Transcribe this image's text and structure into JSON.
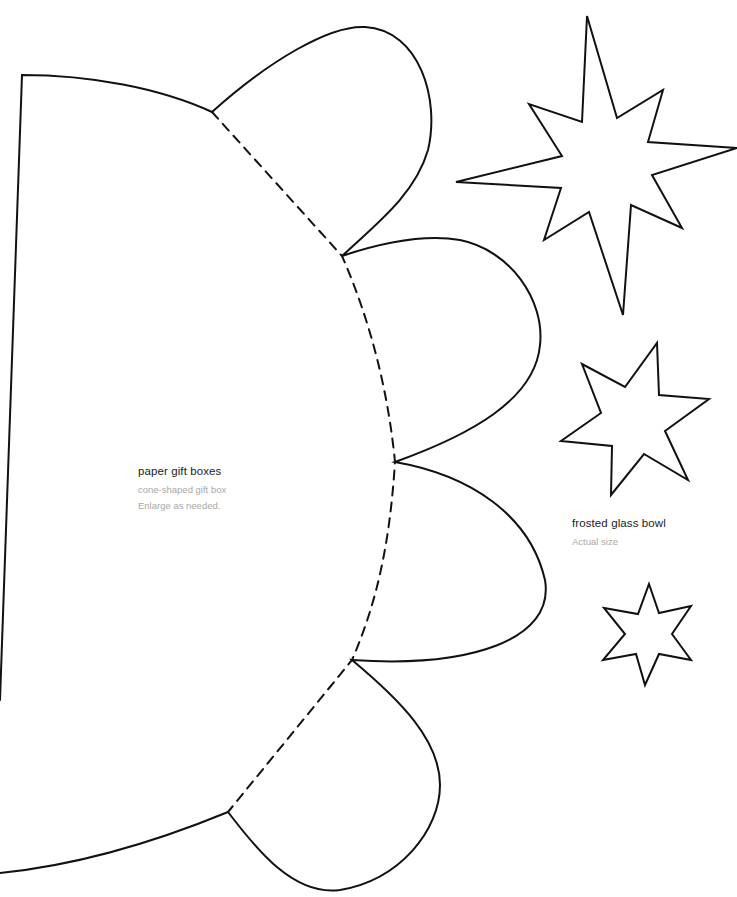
{
  "page": {
    "background": "#ffffff",
    "stroke_color": "#111111"
  },
  "templates": [
    {
      "id": "cone-gift-box",
      "title": "paper gift boxes",
      "subtitle": "cone-shaped gift box",
      "note": "Enlarge as needed."
    },
    {
      "id": "star-cutouts",
      "title": "frosted glass bowl",
      "subtitle": "Actual size"
    }
  ],
  "shapes": {
    "cone_template": {
      "scallops": 4,
      "fold_line": "dashed"
    },
    "stars": [
      {
        "name": "large-eight-point-star",
        "points": 8
      },
      {
        "name": "medium-six-point-star",
        "points": 6
      },
      {
        "name": "small-six-point-star",
        "points": 6
      }
    ]
  }
}
